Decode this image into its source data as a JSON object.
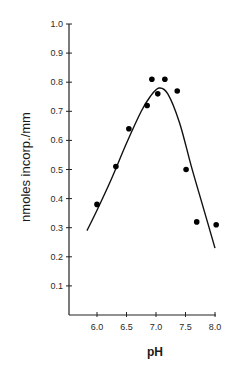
{
  "chart_data": {
    "type": "scatter",
    "title": "",
    "xlabel": "pH",
    "ylabel": "nmoles incorp./mm",
    "xlim": [
      5.55,
      8.1
    ],
    "ylim": [
      0,
      1.0
    ],
    "x_ticks": [
      "6.0",
      "6.5",
      "7.0",
      "7.5",
      "8.0"
    ],
    "y_ticks": [
      "0.1",
      "0.2",
      "0.3",
      "0.4",
      "0.5",
      "0.6",
      "0.7",
      "0.8",
      "0.9",
      "1.0"
    ],
    "grid": false,
    "legend": null,
    "series": [
      {
        "name": "measured",
        "kind": "scatter",
        "x": [
          6.0,
          6.32,
          6.54,
          6.85,
          6.93,
          7.03,
          7.15,
          7.36,
          7.51,
          7.69,
          8.02
        ],
        "y": [
          0.38,
          0.51,
          0.64,
          0.72,
          0.81,
          0.76,
          0.81,
          0.77,
          0.5,
          0.32,
          0.31
        ]
      },
      {
        "name": "fitted curve",
        "kind": "line",
        "x": [
          5.83,
          6.0,
          6.25,
          6.5,
          6.75,
          6.9,
          7.05,
          7.2,
          7.4,
          7.6,
          7.8,
          8.0
        ],
        "y": [
          0.29,
          0.36,
          0.47,
          0.59,
          0.7,
          0.75,
          0.78,
          0.76,
          0.66,
          0.51,
          0.37,
          0.23
        ]
      }
    ]
  }
}
